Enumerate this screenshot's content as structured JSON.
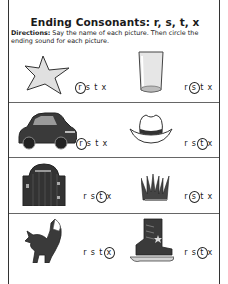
{
  "worksheet": {
    "title": "Ending Consonants: r, s, t, x",
    "directions_label": "Directions:",
    "directions_text": " Say the name of each picture. Then circle the ending sound for each picture."
  },
  "letters": [
    "r",
    "s",
    "t",
    "x"
  ],
  "items": [
    {
      "picture": "star-icon",
      "name": "star",
      "circled": "r"
    },
    {
      "picture": "glass-icon",
      "name": "glass",
      "circled": "s"
    },
    {
      "picture": "car-icon",
      "name": "car",
      "circled": "r"
    },
    {
      "picture": "hat-icon",
      "name": "hat",
      "circled": "t"
    },
    {
      "picture": "gate-icon",
      "name": "gate",
      "circled": "t"
    },
    {
      "picture": "grass-icon",
      "name": "grass",
      "circled": "s"
    },
    {
      "picture": "fox-icon",
      "name": "fox",
      "circled": "x"
    },
    {
      "picture": "skate-icon",
      "name": "skate",
      "circled": "t"
    }
  ],
  "colors": {
    "ink": "#1a1a1a",
    "border": "#333333",
    "picture_fill_dark": "#3a3a3a",
    "picture_fill_light": "#d9d9d9"
  }
}
